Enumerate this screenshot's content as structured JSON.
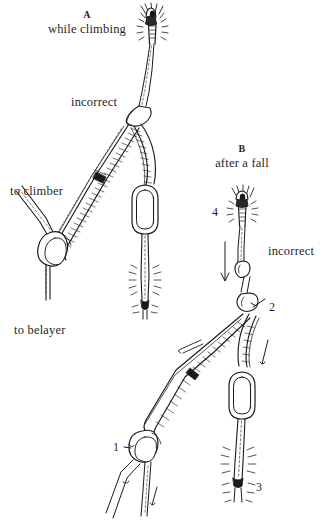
{
  "figure": {
    "type": "technical-line-illustration",
    "background_color": "#ffffff",
    "ink_color": "#1a1a1a",
    "panels": [
      {
        "id": "A",
        "caption": "A",
        "subtitle": "while climbing",
        "verdict": "incorrect",
        "rope_labels": [
          "to climber",
          "to belayer"
        ],
        "components": [
          "piton",
          "sling",
          "carabiner",
          "rope",
          "knot"
        ]
      },
      {
        "id": "B",
        "caption": "B",
        "subtitle": "after a fall",
        "verdict": "incorrect",
        "numbered_callouts": [
          "1",
          "2",
          "3",
          "4"
        ],
        "components": [
          "piton",
          "sling",
          "carabiner",
          "rope",
          "knot"
        ]
      }
    ]
  },
  "labels": {
    "caption_a": "A",
    "subtitle_a": "while climbing",
    "incorrect_a": "incorrect",
    "to_climber": "to climber",
    "to_belayer": "to belayer",
    "caption_b": "B",
    "subtitle_b": "after a fall",
    "incorrect_b": "incorrect",
    "num_1": "1",
    "num_2": "2",
    "num_3": "3",
    "num_4": "4"
  }
}
